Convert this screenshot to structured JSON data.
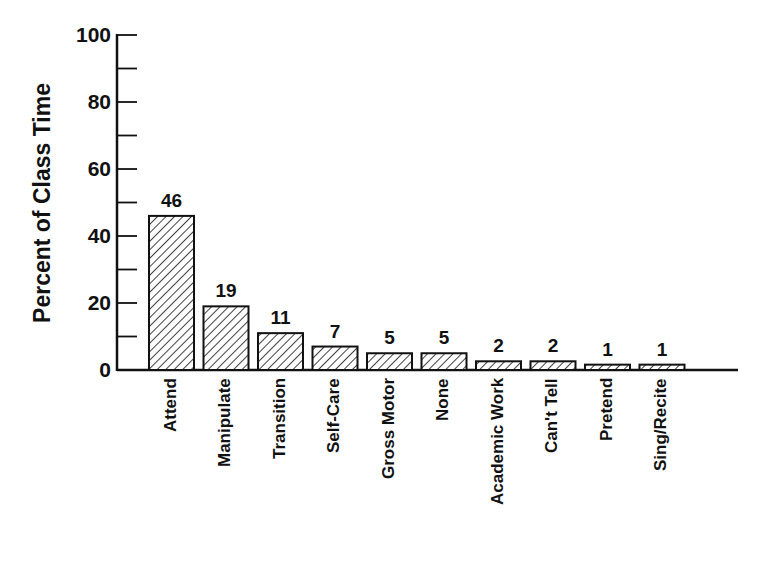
{
  "chart_data": {
    "type": "bar",
    "title": "",
    "xlabel": "",
    "ylabel": "Percent of Class Time",
    "ylim": [
      0,
      100
    ],
    "yticks": [
      0,
      20,
      40,
      60,
      80,
      100
    ],
    "minor_ticks": [
      10,
      30,
      50,
      70,
      90
    ],
    "grid": false,
    "legend": null,
    "bar_pattern": "diagonal-hatch",
    "categories": [
      "Attend",
      "Manipulate",
      "Transition",
      "Self-Care",
      "Gross Motor",
      "None",
      "Academic Work",
      "Can't Tell",
      "Pretend",
      "Sing/Recite"
    ],
    "values": [
      46,
      19,
      11,
      7,
      5,
      5,
      2,
      2,
      1,
      1
    ],
    "value_labels": [
      "46",
      "19",
      "11",
      "7",
      "5",
      "5",
      "2",
      "2",
      "1",
      "1"
    ],
    "colors": {
      "ink": "#111111",
      "background": "#ffffff"
    }
  },
  "axis": {
    "ylabel": "Percent of Class Time",
    "ytick_labels": [
      "0",
      "20",
      "40",
      "60",
      "80",
      "100"
    ]
  }
}
